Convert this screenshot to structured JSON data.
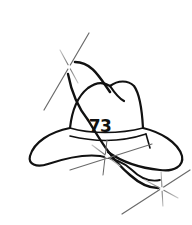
{
  "illustration": {
    "subject": "cowboy hat with sparkles",
    "hat_number": "73",
    "colors": {
      "background": "#ffffff",
      "line": "#111111",
      "sparkle": "#9a9a9a"
    }
  }
}
